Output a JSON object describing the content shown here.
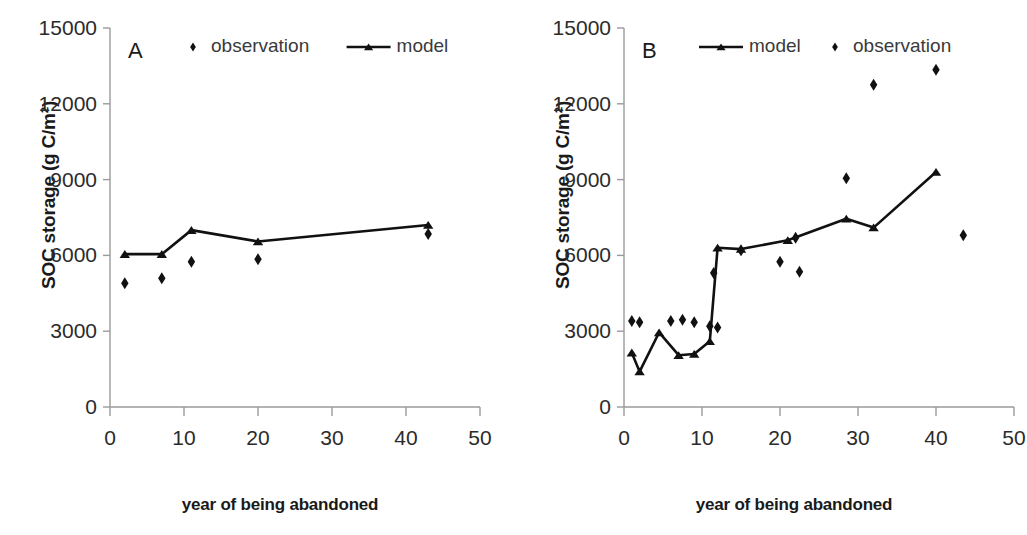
{
  "figure": {
    "panels": [
      {
        "id": "A",
        "letter": "A",
        "x_axis_title": "year of being abandoned",
        "y_axis_title": "SOC storage (g C/m²)",
        "legend": [
          {
            "key": "observation",
            "label": "observation",
            "marker": "diamond"
          },
          {
            "key": "model",
            "label": "model",
            "marker": "line-triangle"
          }
        ]
      },
      {
        "id": "B",
        "letter": "B",
        "x_axis_title": "year of being abandoned",
        "y_axis_title": "SOC storage (g C/m²)",
        "legend": [
          {
            "key": "model",
            "label": "model",
            "marker": "line-triangle"
          },
          {
            "key": "observation",
            "label": "observation",
            "marker": "diamond"
          }
        ]
      }
    ]
  },
  "chart_data": [
    {
      "type": "scatter",
      "panel": "A",
      "title": "A",
      "xlabel": "year of being abandoned",
      "ylabel": "SOC storage (g C/m²)",
      "xlim": [
        0,
        50
      ],
      "ylim": [
        0,
        15000
      ],
      "xticks": [
        0,
        10,
        20,
        30,
        40,
        50
      ],
      "yticks": [
        0,
        3000,
        6000,
        9000,
        12000,
        15000
      ],
      "xtick_labels": [
        "0",
        "10",
        "20",
        "30",
        "40",
        "50"
      ],
      "ytick_labels": [
        "0",
        "3000",
        "6000",
        "9000",
        "12000",
        "15000"
      ],
      "grid": false,
      "legend_position": "top",
      "series": [
        {
          "name": "model",
          "type": "line",
          "marker": "triangle",
          "color": "#111111",
          "x": [
            2,
            7,
            11,
            20,
            43
          ],
          "values": [
            6050,
            6050,
            7000,
            6550,
            7200
          ]
        },
        {
          "name": "observation",
          "type": "scatter",
          "marker": "diamond",
          "color": "#111111",
          "x": [
            2,
            7,
            11,
            20,
            43
          ],
          "values": [
            4900,
            5100,
            5750,
            5850,
            6850
          ]
        }
      ]
    },
    {
      "type": "scatter",
      "panel": "B",
      "title": "B",
      "xlabel": "year of being abandoned",
      "ylabel": "SOC storage (g C/m²)",
      "xlim": [
        0,
        50
      ],
      "ylim": [
        0,
        15000
      ],
      "xticks": [
        0,
        10,
        20,
        30,
        40,
        50
      ],
      "yticks": [
        0,
        3000,
        6000,
        9000,
        12000,
        15000
      ],
      "xtick_labels": [
        "0",
        "10",
        "20",
        "30",
        "40",
        "50"
      ],
      "ytick_labels": [
        "0",
        "3000",
        "6000",
        "9000",
        "12000",
        "15000"
      ],
      "grid": false,
      "legend_position": "top",
      "series": [
        {
          "name": "model",
          "type": "line",
          "marker": "triangle",
          "color": "#111111",
          "x": [
            1,
            2,
            4.5,
            7,
            9,
            11,
            12,
            15,
            21,
            28.5,
            32,
            40
          ],
          "values": [
            2150,
            1400,
            2950,
            2050,
            2100,
            2600,
            6300,
            6250,
            6600,
            7450,
            7100,
            9300
          ]
        },
        {
          "name": "observation",
          "type": "scatter",
          "marker": "diamond",
          "color": "#111111",
          "x": [
            1,
            2,
            6,
            7.5,
            9,
            11,
            11.5,
            12,
            15,
            20,
            22,
            22.5,
            28.5,
            32,
            40,
            43.5
          ],
          "values": [
            3400,
            3350,
            3400,
            3450,
            3350,
            3200,
            5300,
            3150,
            6200,
            5750,
            6700,
            5350,
            9050,
            12750,
            13350,
            6800
          ]
        }
      ]
    }
  ]
}
